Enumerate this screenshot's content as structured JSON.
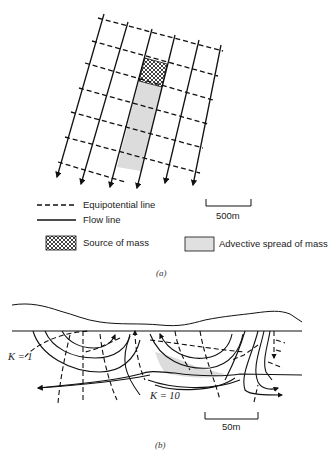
{
  "panel_a": {
    "caption": "(a)",
    "scale_bar": "500m",
    "legend": [
      {
        "key": "equipotential",
        "label": "Equipotential line"
      },
      {
        "key": "flow",
        "label": "Flow line"
      },
      {
        "key": "source",
        "label": "Source of mass"
      },
      {
        "key": "advective",
        "label": "Advective spread of mass"
      }
    ]
  },
  "panel_b": {
    "caption": "(b)",
    "scale_bar": "50m",
    "k_upper": "K = 1",
    "k_lower": "K = 10"
  },
  "colors": {
    "line": "#111111",
    "plume_fill": "#dcdcdc",
    "background": "#ffffff"
  }
}
